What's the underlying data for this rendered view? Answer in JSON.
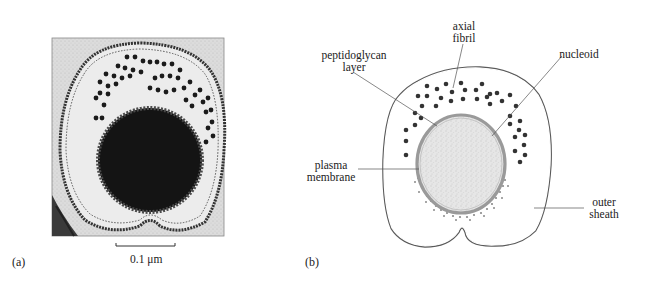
{
  "figure": {
    "panel_a": {
      "label": "(a)",
      "description": "electron micrograph cross-section",
      "scale_bar": {
        "text": "0.1 μm"
      }
    },
    "panel_b": {
      "label": "(b)",
      "description": "labelled diagram of cross-section",
      "labels": {
        "axial_fibril_line1": "axial",
        "axial_fibril_line2": "fibril",
        "peptidoglycan_line1": "peptidoglycan",
        "peptidoglycan_line2": "layer",
        "nucleoid": "nucleoid",
        "plasma_line1": "plasma",
        "plasma_line2": "membrane",
        "outer_line1": "outer",
        "outer_line2": "sheath"
      }
    },
    "colors": {
      "outline": "#555555",
      "peptidoglycan": "#9a9a9a",
      "nucleoid_fill": "#e2e2e2",
      "fibril": "#2a2a2a",
      "micrograph_bg": "#d8d8d8",
      "micrograph_dark": "#141414"
    }
  }
}
